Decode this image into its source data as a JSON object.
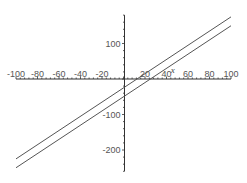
{
  "chart_data": {
    "type": "line",
    "title": "",
    "xlabel": "x",
    "ylabel": "",
    "xlim": [
      -100,
      100
    ],
    "ylim": [
      -260,
      180
    ],
    "grid": false,
    "legend": null,
    "x_ticks": [
      -100,
      -80,
      -60,
      -40,
      -20,
      20,
      40,
      60,
      80,
      100
    ],
    "x_tick_labels": [
      "-100",
      "-80",
      "-60",
      "-40",
      "-20",
      "20",
      "40",
      "60",
      "80",
      "100"
    ],
    "y_ticks": [
      100,
      -100,
      -200
    ],
    "y_tick_labels": [
      "100",
      "-100",
      "-200"
    ],
    "series": [
      {
        "name": "upper line",
        "x": [
          -100,
          100
        ],
        "y": [
          -225,
          175
        ],
        "equation_estimate": "y = 2x - 25"
      },
      {
        "name": "lower line",
        "x": [
          -100,
          100
        ],
        "y": [
          -250,
          150
        ],
        "equation_estimate": "y = 2x - 50"
      }
    ]
  },
  "colors": {
    "axis": "#333333",
    "line": "#555555",
    "background": "#ffffff"
  }
}
